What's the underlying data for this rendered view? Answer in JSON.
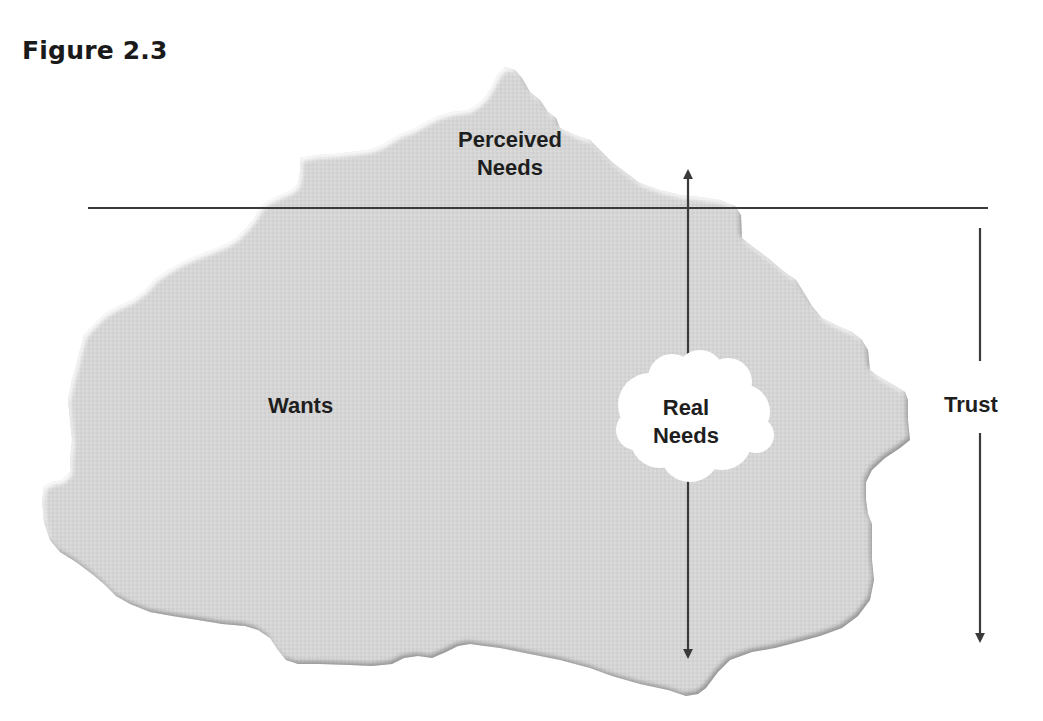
{
  "header": {
    "figure_title": "Figure 2.3"
  },
  "diagram": {
    "type": "iceberg",
    "labels": {
      "above_waterline": [
        "Perceived",
        "Needs"
      ],
      "below_waterline": "Wants",
      "core": [
        "Real",
        "Needs"
      ],
      "side_axis": "Trust"
    },
    "colors": {
      "iceberg_fill": "#d4d4d4",
      "iceberg_edge_shadow": "#9a9a9a",
      "iceberg_highlight": "#f4f4f4",
      "cloud_fill": "#ffffff",
      "line": "#3a3a3a",
      "text": "#1e1e1e",
      "background": "#ffffff"
    },
    "waterline": {
      "x1": 88,
      "x2": 988,
      "y": 208
    },
    "depth_arrow": {
      "x": 688,
      "y_top": 170,
      "y_bottom": 658,
      "heads": "both"
    },
    "trust_arrow": {
      "x": 980,
      "y_top": 228,
      "y_bottom": 643,
      "heads": "down",
      "label_gap": [
        361,
        433
      ]
    }
  }
}
